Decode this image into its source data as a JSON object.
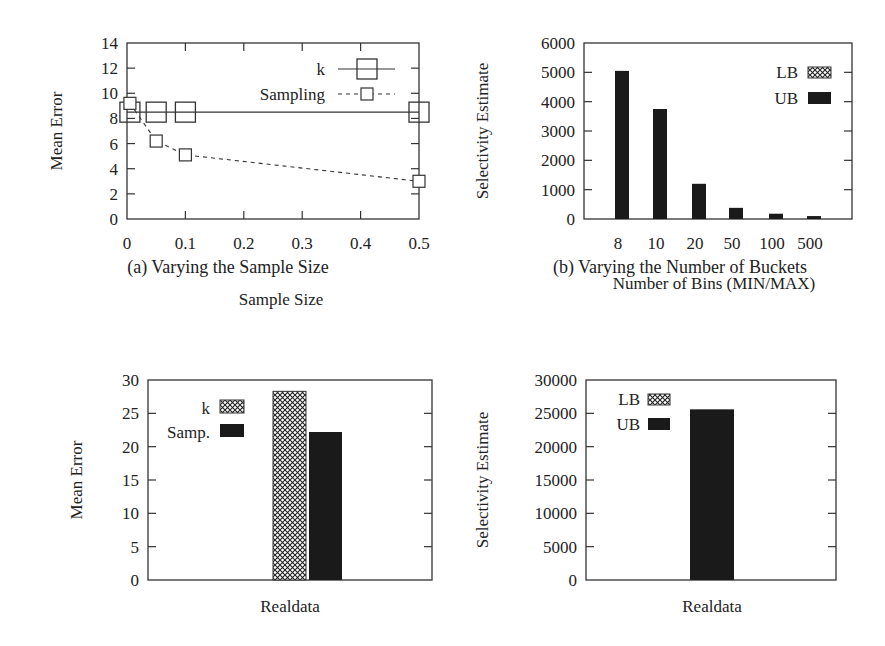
{
  "figure": {
    "captions": [
      "(a) Varying the Sample Size",
      "(b) Varying the Number of Buckets"
    ]
  },
  "chart_data": [
    {
      "id": "a",
      "type": "line",
      "caption": "(a) Varying the Sample Size",
      "xlabel": "Sample Size",
      "ylabel": "Mean Error",
      "xlim": [
        0,
        0.5
      ],
      "ylim": [
        0,
        14
      ],
      "xticks": [
        "0",
        "0.1",
        "0.2",
        "0.3",
        "0.4",
        "0.5"
      ],
      "yticks": [
        "0",
        "2",
        "4",
        "6",
        "8",
        "10",
        "12",
        "14"
      ],
      "legend_position": "top-right",
      "grid": false,
      "series": [
        {
          "name": "k",
          "style": "solid",
          "marker": "large-square",
          "x": [
            0.005,
            0.05,
            0.1,
            0.5
          ],
          "values": [
            8.5,
            8.5,
            8.5,
            8.5
          ]
        },
        {
          "name": "Sampling",
          "style": "dashed",
          "marker": "small-square",
          "x": [
            0.005,
            0.05,
            0.1,
            0.5
          ],
          "values": [
            9.2,
            6.2,
            5.1,
            3.0
          ]
        }
      ]
    },
    {
      "id": "b",
      "type": "bar",
      "caption": "(b) Varying the Number of Buckets",
      "xlabel": "Number of Bins (MIN/MAX)",
      "ylabel": "Selectivity Estimate",
      "ylim": [
        0,
        6000
      ],
      "yticks": [
        "0",
        "1000",
        "2000",
        "3000",
        "4000",
        "5000",
        "6000"
      ],
      "categories": [
        "8",
        "10",
        "20",
        "50",
        "100",
        "500"
      ],
      "legend_position": "top-right",
      "grid": false,
      "series": [
        {
          "name": "LB",
          "pattern": "crosshatch",
          "values": [
            0,
            0,
            0,
            0,
            0,
            0
          ]
        },
        {
          "name": "UB",
          "pattern": "solid",
          "values": [
            5050,
            3750,
            1200,
            380,
            180,
            100
          ]
        }
      ]
    },
    {
      "id": "c",
      "type": "bar",
      "caption": "",
      "xlabel": "Realdata",
      "ylabel": "Mean Error",
      "ylim": [
        0,
        30
      ],
      "yticks": [
        "0",
        "5",
        "10",
        "15",
        "20",
        "25",
        "30"
      ],
      "categories": [
        "Realdata"
      ],
      "legend_position": "top-left",
      "grid": false,
      "series": [
        {
          "name": "k",
          "pattern": "crosshatch",
          "values": [
            28.3
          ]
        },
        {
          "name": "Samp.",
          "pattern": "solid",
          "values": [
            22.2
          ]
        }
      ]
    },
    {
      "id": "d",
      "type": "bar",
      "caption": "",
      "xlabel": "Realdata",
      "ylabel": "Selectivity Estimate",
      "ylim": [
        0,
        30000
      ],
      "yticks": [
        "0",
        "5000",
        "10000",
        "15000",
        "20000",
        "25000",
        "30000"
      ],
      "categories": [
        "Realdata"
      ],
      "legend_position": "top-left",
      "grid": false,
      "series": [
        {
          "name": "LB",
          "pattern": "crosshatch",
          "values": [
            0
          ]
        },
        {
          "name": "UB",
          "pattern": "solid",
          "values": [
            25600
          ]
        }
      ]
    }
  ]
}
